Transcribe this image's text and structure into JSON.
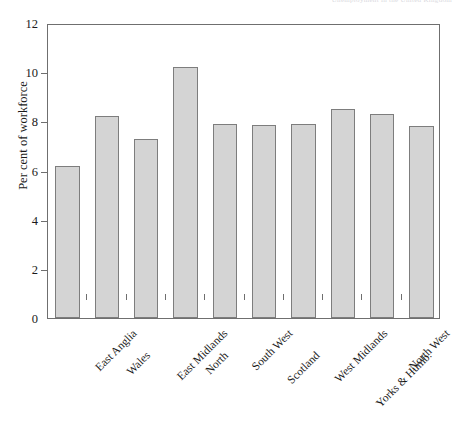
{
  "page_header": "Unemployment in the United Kingdom",
  "chart_data": {
    "type": "bar",
    "title": "",
    "subtitle": "",
    "xlabel": "",
    "ylabel": "Per cent of workforce",
    "categories": [
      "East Anglia",
      "Wales",
      "East Midlands",
      "North",
      "South West",
      "Scotland",
      "West Midlands",
      "Yorks & Humb.",
      "North West",
      "South East (incl. London)"
    ],
    "values": [
      6.2,
      8.2,
      7.3,
      10.2,
      7.9,
      7.85,
      7.9,
      8.5,
      8.3,
      7.8
    ],
    "ylim": [
      0,
      12
    ],
    "yticks": [
      0,
      2,
      4,
      6,
      8,
      10,
      12
    ],
    "ytick_labels": [
      "0",
      "2",
      "4",
      "6",
      "8",
      "10",
      "12"
    ],
    "grid": false,
    "legend": null,
    "bar_fill_color": "#d4d4d4",
    "bar_edge_color": "#7d7d7d",
    "axis_color": "#6f6f6f"
  }
}
